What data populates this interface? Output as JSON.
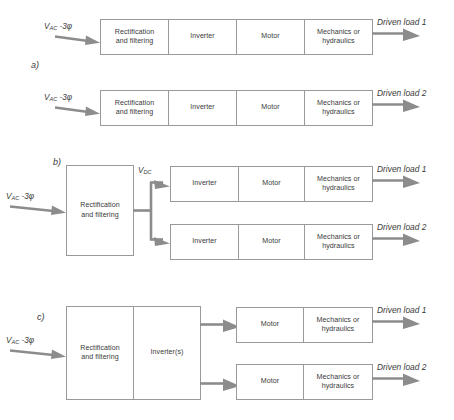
{
  "figure": {
    "title_fragment": "",
    "blocks": {
      "rectification": "Rectification\nand filtering",
      "rectification_line1": "Rectification",
      "rectification_line2": "and filtering",
      "inverter": "Inverter",
      "inverters": "Inverter(s)",
      "motor": "Motor",
      "mechanics_line1": "Mechanics or",
      "mechanics_line2": "hydraulics"
    },
    "signals": {
      "vac_prefix": "V",
      "vac_sub": "AC",
      "vac_suffix": " -3φ",
      "vdc_prefix": "V",
      "vdc_sub": "DC",
      "vdc_suffix": ""
    },
    "loads": {
      "load1": "Driven load 1",
      "load2": "Driven load 2"
    },
    "section_labels": {
      "a": "a)",
      "b": "b)",
      "c": "c)"
    },
    "colors": {
      "box_stroke": "#9a9a9a",
      "flow": "#8c8c8c",
      "text": "#3a3a3a",
      "background": "#ffffff"
    },
    "sections": [
      {
        "id": "a",
        "label": "a)",
        "description": "Two independent drive chains, each with its own rectification and filtering, inverter, motor and mechanics",
        "chains": [
          {
            "input": "V_AC -3φ",
            "stages": [
              "Rectification and filtering",
              "Inverter",
              "Motor",
              "Mechanics or hydraulics"
            ],
            "output": "Driven load 1"
          },
          {
            "input": "V_AC -3φ",
            "stages": [
              "Rectification and filtering",
              "Inverter",
              "Motor",
              "Mechanics or hydraulics"
            ],
            "output": "Driven load 2"
          }
        ]
      },
      {
        "id": "b",
        "label": "b)",
        "description": "Shared rectification and filtering feeding a common DC bus to two separate inverters",
        "input": "V_AC -3φ",
        "shared_stages": [
          "Rectification and filtering"
        ],
        "bus": "V_DC",
        "branches": [
          {
            "stages": [
              "Inverter",
              "Motor",
              "Mechanics or hydraulics"
            ],
            "output": "Driven load 1"
          },
          {
            "stages": [
              "Inverter",
              "Motor",
              "Mechanics or hydraulics"
            ],
            "output": "Driven load 2"
          }
        ]
      },
      {
        "id": "c",
        "label": "c)",
        "description": "Shared rectification, filtering and inverter(s) feeding two motor branches",
        "input": "V_AC -3φ",
        "shared_stages": [
          "Rectification and filtering",
          "Inverter(s)"
        ],
        "branches": [
          {
            "stages": [
              "Motor",
              "Mechanics or hydraulics"
            ],
            "output": "Driven load 1"
          },
          {
            "stages": [
              "Motor",
              "Mechanics or hydraulics"
            ],
            "output": "Driven load 2"
          }
        ]
      }
    ]
  }
}
